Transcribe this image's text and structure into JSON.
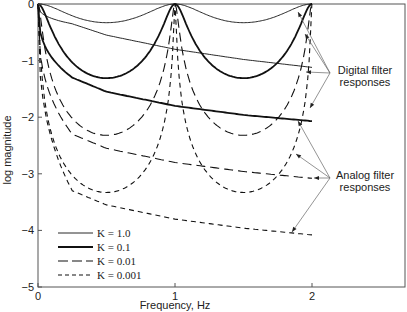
{
  "chart_data": {
    "type": "line",
    "title": "",
    "xlabel": "Frequency, Hz",
    "ylabel": "log magnitude",
    "xlim": [
      0,
      2.7
    ],
    "ylim": [
      -5,
      0
    ],
    "grid": false,
    "x_ticks": [
      "0",
      "1",
      "2"
    ],
    "y_ticks": [
      "0",
      "-1",
      "-2",
      "-3",
      "-4",
      "-5"
    ],
    "legend_position": "lower-left",
    "legend": [
      {
        "label": "K = 1.0",
        "style": "thin-solid"
      },
      {
        "label": "K = 0.1",
        "style": "thick-solid"
      },
      {
        "label": "K = 0.01",
        "style": "long-dash"
      },
      {
        "label": "K = 0.001",
        "style": "short-dash"
      }
    ],
    "series": [
      {
        "name": "K = 1.0 digital",
        "K": 1.0,
        "kind": "digital",
        "x": [
          0,
          0.5,
          1,
          1.5,
          2
        ],
        "y": [
          0,
          -0.33,
          0,
          -0.33,
          0
        ]
      },
      {
        "name": "K = 0.1 digital",
        "K": 0.1,
        "kind": "digital",
        "x": [
          0,
          0.5,
          1,
          1.5,
          2
        ],
        "y": [
          0,
          -1.31,
          0,
          -1.31,
          0
        ]
      },
      {
        "name": "K = 0.01 digital",
        "K": 0.01,
        "kind": "digital",
        "x": [
          0,
          0.5,
          1,
          1.5,
          2
        ],
        "y": [
          0,
          -2.32,
          0,
          -2.32,
          0
        ]
      },
      {
        "name": "K = 0.001 digital",
        "K": 0.001,
        "kind": "digital",
        "x": [
          0,
          0.5,
          1,
          1.5,
          2
        ],
        "y": [
          0,
          -3.33,
          0,
          -3.33,
          0
        ]
      },
      {
        "name": "K = 1.0 analog",
        "K": 1.0,
        "kind": "analog",
        "x": [
          0,
          0.25,
          0.5,
          1,
          1.5,
          2
        ],
        "y": [
          0,
          -0.35,
          -0.55,
          -0.8,
          -0.98,
          -1.12
        ]
      },
      {
        "name": "K = 0.1 analog",
        "K": 0.1,
        "kind": "analog",
        "x": [
          0,
          0.25,
          0.5,
          1,
          1.5,
          2
        ],
        "y": [
          0,
          -1.3,
          -1.55,
          -1.8,
          -1.96,
          -2.07
        ]
      },
      {
        "name": "K = 0.01 analog",
        "K": 0.01,
        "kind": "analog",
        "x": [
          0,
          0.25,
          0.5,
          1,
          1.5,
          2
        ],
        "y": [
          0,
          -2.3,
          -2.55,
          -2.8,
          -2.96,
          -3.08
        ]
      },
      {
        "name": "K = 0.001 analog",
        "K": 0.001,
        "kind": "analog",
        "x": [
          0,
          0.25,
          0.5,
          1,
          1.5,
          2
        ],
        "y": [
          0,
          -3.3,
          -3.55,
          -3.8,
          -3.96,
          -4.08
        ]
      }
    ],
    "annotations": [
      {
        "text": [
          "Digital filter",
          "responses"
        ]
      },
      {
        "text": [
          "Analog filter",
          "responses"
        ]
      }
    ]
  }
}
